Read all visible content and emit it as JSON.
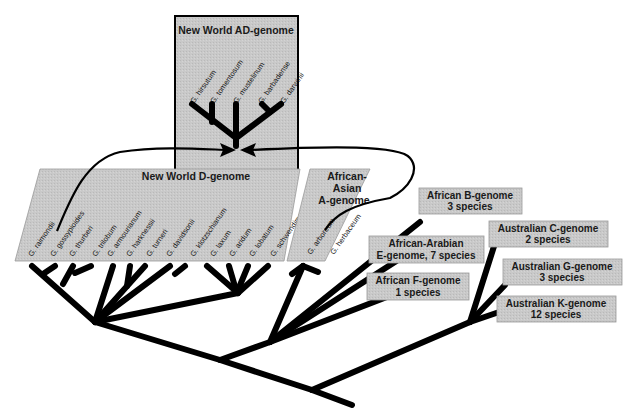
{
  "groups": {
    "ad_genome": {
      "title": "New World AD-genome",
      "species": [
        "G. hirsutum",
        "G. tomentosum",
        "G. mustelinum",
        "G. barbadense",
        "G. darwinii"
      ]
    },
    "d_genome": {
      "title": "New World D-genome",
      "species": [
        "G. raimondii",
        "G. gossypioides",
        "G. thurberi",
        "G. trilobum",
        "G. armourianum",
        "G. harknessii",
        "G. turneri",
        "G. davidsonii",
        "G. klotzschianum",
        "G. laxum",
        "G. aridum",
        "G. lobatum",
        "G. schwendimanii"
      ]
    },
    "a_genome": {
      "title_line1": "African-",
      "title_line2": "Asian",
      "title_line3": "A-genome",
      "species": [
        "G. arboreum",
        "G. herbaceum"
      ]
    },
    "b_genome": {
      "line1": "African B-genome",
      "line2": "3 species"
    },
    "e_genome": {
      "line1": "African-Arabian",
      "line2": "E-genome, 7 species"
    },
    "f_genome": {
      "line1": "African F-genome",
      "line2": "1 species"
    },
    "c_genome": {
      "line1": "Australian C-genome",
      "line2": "2 species"
    },
    "g_genome": {
      "line1": "Australian G-genome",
      "line2": "3 species"
    },
    "k_genome": {
      "line1": "Australian K-genome",
      "line2": "12 species"
    }
  },
  "colors": {
    "box_fill": "#c8c8c8",
    "box_border": "#000000",
    "branch": "#000000"
  }
}
